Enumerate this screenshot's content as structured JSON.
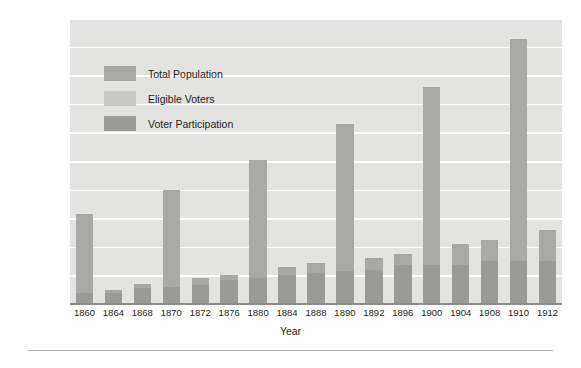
{
  "chart_data": {
    "type": "bar",
    "title": "",
    "xlabel": "Year",
    "ylabel": "Number of People (Millions)",
    "ylim": [
      0,
      100
    ],
    "ytick_step": 10,
    "yticks": [
      "100",
      "90",
      "80",
      "70",
      "60",
      "50",
      "40",
      "30",
      "20",
      "10",
      "0"
    ],
    "grid": true,
    "grid_axis": "y",
    "legend_position": "upper-left-inside",
    "stacked": true,
    "categories": [
      "1860",
      "1864",
      "1868",
      "1870",
      "1872",
      "1876",
      "1880",
      "1884",
      "1888",
      "1890",
      "1892",
      "1896",
      "1900",
      "1904",
      "1908",
      "1910",
      "1912"
    ],
    "series": [
      {
        "name": "Total Population",
        "color": "#a8a8a6",
        "values": [
          31.5,
          5.0,
          7.0,
          40.0,
          9.0,
          10.0,
          50.5,
          13.0,
          14.5,
          63.0,
          16.0,
          17.5,
          76.0,
          21.0,
          22.5,
          92.5,
          26.0
        ]
      },
      {
        "name": "Eligible Voters",
        "color": "#c8c8c6",
        "values": [
          null,
          null,
          null,
          null,
          null,
          null,
          null,
          null,
          null,
          null,
          null,
          null,
          null,
          null,
          null,
          null,
          null
        ]
      },
      {
        "name": "Voter Participation",
        "color": "#9a9a98",
        "values": [
          4.0,
          4.0,
          5.5,
          6.0,
          6.5,
          8.5,
          9.0,
          10.0,
          11.0,
          11.5,
          12.0,
          13.5,
          13.5,
          13.5,
          15.0,
          15.0,
          15.0
        ]
      }
    ]
  },
  "axes": {
    "y_label": "Number of People (Millions)",
    "x_label": "Year"
  },
  "legend": {
    "items": [
      {
        "label": "Total Population",
        "color": "#a8a8a6"
      },
      {
        "label": "Eligible Voters",
        "color": "#c8c8c6"
      },
      {
        "label": "Voter Participation",
        "color": "#9a9a98"
      }
    ]
  },
  "colors": {
    "plot_background": "#e3e3e1",
    "gridline": "#ffffff",
    "axis_line": "#8c8c8c",
    "text": "#231f20",
    "rule": "#b0b0ae"
  }
}
